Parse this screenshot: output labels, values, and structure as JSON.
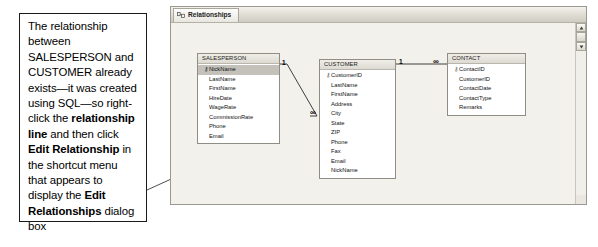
{
  "callout": {
    "name": "instruction-callout",
    "segments": [
      {
        "text": "The relationship between SALESPERSON and CUSTOMER already exists—it was created using SQL—so right-click the ",
        "bold": false
      },
      {
        "text": "relationship line",
        "bold": true
      },
      {
        "text": " and then click ",
        "bold": false
      },
      {
        "text": "Edit Relationship",
        "bold": true
      },
      {
        "text": " in the shortcut menu that appears to display the ",
        "bold": false
      },
      {
        "text": "Edit Relationships",
        "bold": true
      },
      {
        "text": " dialog box",
        "bold": false
      }
    ],
    "plain_text": "The relationship between SALESPERSON and CUSTOMER already exists—it was created using SQL—so right-click the relationship line and then click Edit Relationship in the shortcut menu that appears to display the Edit Relationships dialog box"
  },
  "window": {
    "tab_label": "Relationships",
    "tab_icon": "relationships-icon",
    "scroll_up_icon": "scroll-up-arrow-icon",
    "scroll_down_icon": "scroll-down-arrow-icon",
    "scroll_thumb": "scrollbar-thumb",
    "canvas_color": "#f2f1ec",
    "chrome_color": "#eceae4"
  },
  "tables": [
    {
      "name": "SALESPERSON",
      "fields": [
        {
          "label": "NickName",
          "key": true,
          "selected": true
        },
        {
          "label": "LastName",
          "key": false,
          "selected": false
        },
        {
          "label": "FirstName",
          "key": false,
          "selected": false
        },
        {
          "label": "HireDate",
          "key": false,
          "selected": false
        },
        {
          "label": "WageRate",
          "key": false,
          "selected": false
        },
        {
          "label": "CommissionRate",
          "key": false,
          "selected": false
        },
        {
          "label": "Phone",
          "key": false,
          "selected": false
        },
        {
          "label": "Email",
          "key": false,
          "selected": false
        }
      ]
    },
    {
      "name": "CUSTOMER",
      "fields": [
        {
          "label": "CustomerID",
          "key": true,
          "selected": false
        },
        {
          "label": "LastName",
          "key": false,
          "selected": false
        },
        {
          "label": "FirstName",
          "key": false,
          "selected": false
        },
        {
          "label": "Address",
          "key": false,
          "selected": false
        },
        {
          "label": "City",
          "key": false,
          "selected": false
        },
        {
          "label": "State",
          "key": false,
          "selected": false
        },
        {
          "label": "ZIP",
          "key": false,
          "selected": false
        },
        {
          "label": "Phone",
          "key": false,
          "selected": false
        },
        {
          "label": "Fax",
          "key": false,
          "selected": false
        },
        {
          "label": "Email",
          "key": false,
          "selected": false
        },
        {
          "label": "NickName",
          "key": false,
          "selected": false
        }
      ]
    },
    {
      "name": "CONTACT",
      "fields": [
        {
          "label": "ContactID",
          "key": true,
          "selected": false
        },
        {
          "label": "CustomerID",
          "key": false,
          "selected": false
        },
        {
          "label": "ContactDate",
          "key": false,
          "selected": false
        },
        {
          "label": "ContactType",
          "key": false,
          "selected": false
        },
        {
          "label": "Remarks",
          "key": false,
          "selected": false
        }
      ]
    }
  ],
  "relationships": [
    {
      "from": "SALESPERSON",
      "to": "CUSTOMER",
      "from_cardinality": "1",
      "to_cardinality": "∞"
    },
    {
      "from": "CUSTOMER",
      "to": "CONTACT",
      "from_cardinality": "1",
      "to_cardinality": "∞"
    }
  ],
  "key_glyph": "⚷"
}
